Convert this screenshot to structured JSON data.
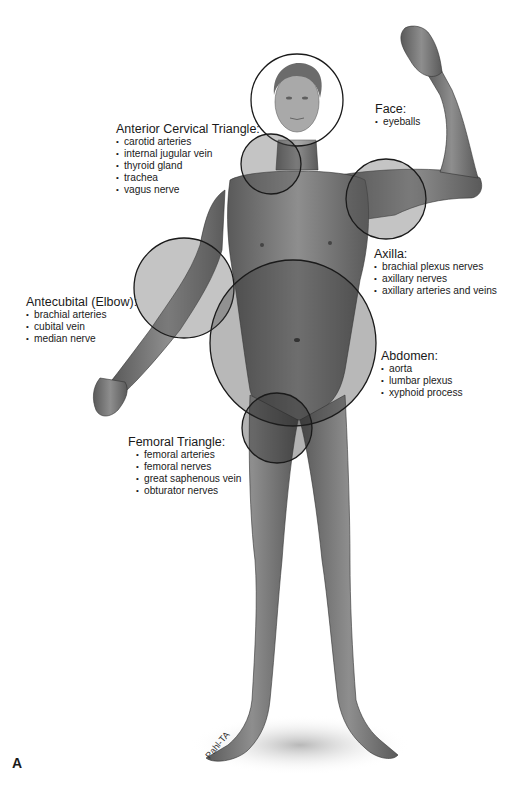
{
  "figure": {
    "panel_letter": "A",
    "regions": [
      {
        "id": "face",
        "title": "Face:",
        "items": [
          "eyeballs"
        ],
        "circle": {
          "cx": 297,
          "cy": 100,
          "r": 46,
          "fill": "#ffffff",
          "fill_opacity": 0.25
        }
      },
      {
        "id": "anterior-cervical",
        "title": "Anterior Cervical Triangle:",
        "items": [
          "carotid arteries",
          "internal jugular vein",
          "thyroid gland",
          "trachea",
          "vagus nerve"
        ],
        "circle": {
          "cx": 271,
          "cy": 164,
          "r": 30,
          "fill": "#555555",
          "fill_opacity": 0.35
        }
      },
      {
        "id": "axilla",
        "title": "Axilla:",
        "items": [
          "brachial plexus nerves",
          "axillary nerves",
          "axillary arteries and veins"
        ],
        "circle": {
          "cx": 386,
          "cy": 199,
          "r": 40,
          "fill": "#555555",
          "fill_opacity": 0.35
        }
      },
      {
        "id": "antecubital",
        "title": "Antecubital (Elbow):",
        "items": [
          "brachial arteries",
          "cubital vein",
          "median nerve"
        ],
        "circle": {
          "cx": 184,
          "cy": 288,
          "r": 50,
          "fill": "#555555",
          "fill_opacity": 0.35
        }
      },
      {
        "id": "abdomen",
        "title": "Abdomen:",
        "items": [
          "aorta",
          "lumbar plexus",
          "xyphoid process"
        ],
        "circle": {
          "cx": 293,
          "cy": 343,
          "r": 83,
          "fill": "#333333",
          "fill_opacity": 0.35
        }
      },
      {
        "id": "femoral",
        "title": "Femoral Triangle:",
        "items": [
          "femoral arteries",
          "femoral nerves",
          "great saphenous vein",
          "obturator nerves"
        ],
        "circle": {
          "cx": 277,
          "cy": 428,
          "r": 35,
          "fill": "#222222",
          "fill_opacity": 0.35
        }
      }
    ],
    "colors": {
      "skin": "#8a8a8a",
      "skin_dark": "#5e5e5e",
      "outline": "#1a1a1a",
      "background": "#ffffff"
    }
  }
}
